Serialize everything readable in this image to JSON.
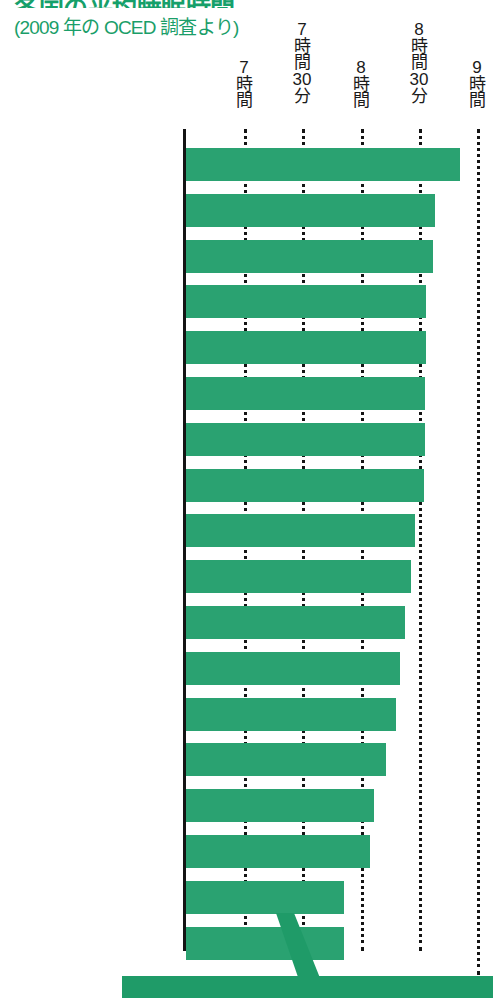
{
  "header": {
    "title_main": "各国の平均睡眠時間",
    "title_sub": "(2009 年の OCED 調査より)"
  },
  "axis": {
    "ticks": [
      {
        "label_lines": [
          "7",
          "時",
          "間"
        ],
        "value_minutes": 420,
        "x": 244
      },
      {
        "label_lines": [
          "7",
          "時",
          "間",
          "30",
          "分"
        ],
        "value_minutes": 450,
        "x": 302
      },
      {
        "label_lines": [
          "8",
          "時",
          "間"
        ],
        "value_minutes": 480,
        "x": 361
      },
      {
        "label_lines": [
          "8",
          "時",
          "間",
          "30",
          "分"
        ],
        "value_minutes": 510,
        "x": 419
      },
      {
        "label_lines": [
          "9",
          "時",
          "間"
        ],
        "value_minutes": 540,
        "x": 477
      }
    ],
    "axis_origin_minutes": 385,
    "pixels_per_30min": 58.3
  },
  "colors": {
    "bar_green": "#2aa271",
    "title_green": "#1a9e69",
    "axis_black": "#141414",
    "banner_green": "#1f9b68",
    "background": "#ffffff"
  },
  "chart_data": {
    "type": "bar",
    "orientation": "horizontal",
    "title": "各国の平均睡眠時間",
    "subtitle": "(2009 年の OCED 調査より)",
    "xlabel": "",
    "ylabel": "",
    "xlim": [
      385,
      545
    ],
    "xtick_labels": [
      "7時間",
      "7時間30分",
      "8時間",
      "8時間30分",
      "9時間"
    ],
    "xtick_values": [
      420,
      450,
      480,
      510,
      540
    ],
    "grid": true,
    "legend": null,
    "value_unit": "minutes",
    "categories": [
      "フランス",
      "米国",
      "スペイン",
      "ニュージーランド",
      "トルコ",
      "オーストラリア",
      "カナダ",
      "ポーランド",
      "フィンランド",
      "ベルギー",
      "英国",
      "メキシコ",
      "イタリア",
      "ドイツ",
      "スウェーデン",
      "ノルウェー",
      "日本",
      "韓国"
    ],
    "values": [
      526,
      513,
      512,
      508,
      508,
      508,
      508,
      508,
      503,
      501,
      498,
      495,
      493,
      488,
      482,
      480,
      467,
      467
    ],
    "value_labels": [
      "8時間46分",
      "8時間33分",
      "8時間32分",
      "8時間28分",
      "8時間28分",
      "8時間28分",
      "8時間28分",
      "8時間28分",
      "8時間23分",
      "8時間21分",
      "8時間18分",
      "8時間15分",
      "8時間13分",
      "8時間08分",
      "8時間02分",
      "8時間00分",
      "7時間47分",
      "7時間47分"
    ],
    "bar_end_px": [
      460,
      435,
      433,
      426,
      426,
      425,
      425,
      424,
      415,
      411,
      405,
      400,
      396,
      386,
      374,
      370,
      344,
      344
    ],
    "highlight_category": "日本"
  },
  "callout": {
    "arrow_target": "日本",
    "banner_text": ""
  }
}
